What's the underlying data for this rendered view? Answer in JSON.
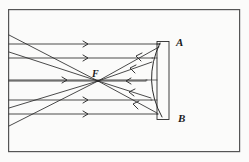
{
  "figure": {
    "background_color": "#fbfbfa",
    "ink_color": "#2b2b2b",
    "frame": {
      "name": "figure-border",
      "x": 8,
      "y": 9,
      "width": 232,
      "height": 143,
      "stroke_color": "#555555",
      "stroke_width": 1.2
    },
    "labels": [
      {
        "id": "A",
        "text": "A",
        "x": 176,
        "y": 46,
        "font_size": 11
      },
      {
        "id": "B",
        "text": "B",
        "x": 178,
        "y": 122,
        "font_size": 11
      },
      {
        "id": "F",
        "text": "F",
        "x": 92,
        "y": 77,
        "font_size": 10
      }
    ],
    "focal_point": {
      "name": "focal-point-F",
      "x": 98,
      "y": 81
    },
    "mirror": {
      "name": "concave-mirror",
      "backing_rect": {
        "x": 157,
        "y": 41,
        "width": 12,
        "height": 78
      },
      "arc": {
        "top_x": 160,
        "top_y": 43,
        "bottom_x": 162,
        "bottom_y": 117,
        "bulge_x": 143
      },
      "rung_count": 5
    },
    "incoming_rays": {
      "name": "incoming-parallel-rays",
      "direction": "rightward",
      "arrow_glyph": ">",
      "x_start": 9,
      "arrow_x": 86,
      "ys": [
        44,
        58,
        80,
        100,
        114
      ]
    },
    "reflected_rays": {
      "name": "reflected-converging-rays",
      "direction": "leftward",
      "arrow_glyph": "<",
      "converge_at": {
        "x": 98,
        "y": 81
      },
      "mirror_ys": [
        47,
        62,
        81,
        98,
        113
      ]
    },
    "diverging_rays": {
      "name": "diverging-rays-past-focus",
      "from": {
        "x": 98,
        "y": 81
      },
      "to_left_edge_ys": [
        35,
        52,
        81,
        108,
        126
      ]
    }
  }
}
